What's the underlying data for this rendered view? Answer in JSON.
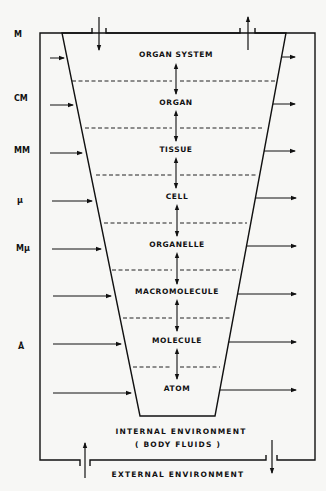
{
  "diagram": {
    "type": "hierarchy-levels",
    "levels": [
      {
        "label": "ORGAN SYSTEM",
        "y": 57
      },
      {
        "label": "ORGAN",
        "y": 104
      },
      {
        "label": "TISSUE",
        "y": 151
      },
      {
        "label": "CELL",
        "y": 199
      },
      {
        "label": "ORGANELLE",
        "y": 246
      },
      {
        "label": "MACROMOLECULE",
        "y": 294
      },
      {
        "label": "MOLECULE",
        "y": 343
      },
      {
        "label": "ATOM",
        "y": 391
      }
    ],
    "scale_units": [
      {
        "label": "M",
        "y": 36
      },
      {
        "label": "CM",
        "y": 100
      },
      {
        "label": "MM",
        "y": 152
      },
      {
        "label": "µ",
        "y": 202
      },
      {
        "label": "Mµ",
        "y": 250
      },
      {
        "label": "Å",
        "y": 347
      }
    ],
    "internal_environment": "INTERNAL ENVIRONMENT",
    "body_fluids": "( BODY FLUIDS )",
    "external_environment": "EXTERNAL ENVIRONMENT"
  }
}
